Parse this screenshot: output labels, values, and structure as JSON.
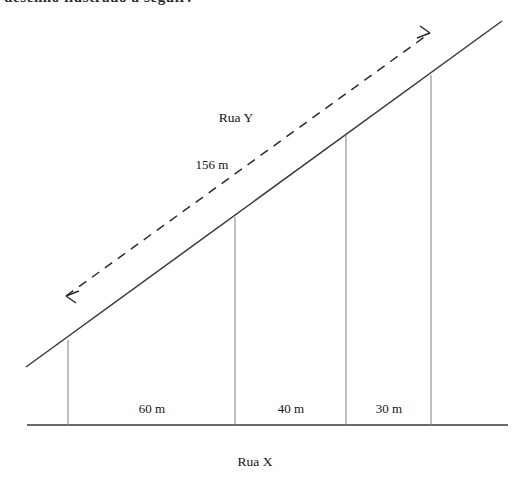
{
  "figure": {
    "title_fragment": "desenho ilustrado a seguir:",
    "roads": {
      "upper_road_label": "Rua Y",
      "lower_road_label": "Rua X"
    },
    "hypotenuse_label": "156 m",
    "segments": [
      {
        "label": "60 m",
        "value": 60,
        "unit": "m"
      },
      {
        "label": "40 m",
        "value": 40,
        "unit": "m"
      },
      {
        "label": "30 m",
        "value": 30,
        "unit": "m"
      }
    ],
    "colors": {
      "stroke": "#3a3a3a",
      "thin_stroke": "#6b6b6b",
      "dashed_stroke": "#2b2b2b",
      "background": "#ffffff",
      "text": "#141414"
    },
    "geometry": {
      "baseline": {
        "x1": 27,
        "y1": 425,
        "x2": 508,
        "y2": 425
      },
      "slant_line": {
        "x1": 26,
        "y1": 367,
        "x2": 502,
        "y2": 21
      },
      "dashed_line": {
        "x1": 66,
        "y1": 296,
        "x2": 430,
        "y2": 33,
        "arrows": "both"
      },
      "verticals": [
        {
          "x": 68,
          "y_top": 340,
          "y_bottom": 425
        },
        {
          "x": 235,
          "y_top": 217,
          "y_bottom": 425
        },
        {
          "x": 346,
          "y_top": 135,
          "y_bottom": 425
        },
        {
          "x": 431,
          "y_top": 75,
          "y_bottom": 425
        }
      ]
    },
    "label_positions": {
      "rua_y": {
        "x": 236,
        "y": 118
      },
      "hyp": {
        "x": 212,
        "y": 165
      },
      "rua_x": {
        "x": 255,
        "y": 462
      },
      "seg_60": {
        "x": 152,
        "y": 409
      },
      "seg_40": {
        "x": 291,
        "y": 409
      },
      "seg_30": {
        "x": 389,
        "y": 409
      }
    }
  }
}
